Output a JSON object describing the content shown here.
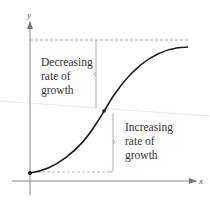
{
  "diagram": {
    "type": "logistic-growth-curve",
    "axes": {
      "x_label": "x",
      "y_label": "y"
    },
    "annotations": {
      "upper": [
        "Decreasing",
        "rate of",
        "growth"
      ],
      "lower": [
        "Increasing",
        "rate of",
        "growth"
      ]
    },
    "colors": {
      "curve": "#1a1a1a",
      "axis": "#888888",
      "dashed": "#999999",
      "text": "#333333"
    }
  }
}
